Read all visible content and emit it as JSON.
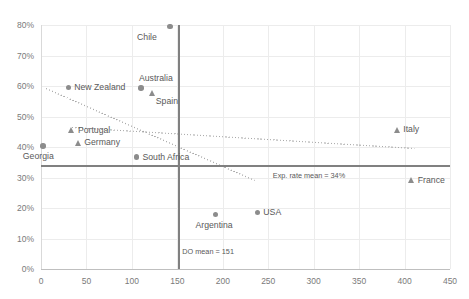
{
  "chart_data": {
    "type": "scatter",
    "title": "",
    "xlabel": "",
    "ylabel": "",
    "xlim": [
      0,
      450
    ],
    "ylim": [
      0,
      0.8
    ],
    "xticks": [
      "0",
      "50",
      "100",
      "150",
      "200",
      "250",
      "300",
      "350",
      "400",
      "450"
    ],
    "yticks": [
      "0%",
      "10%",
      "20%",
      "30%",
      "40%",
      "50%",
      "60%",
      "70%",
      "80%"
    ],
    "grid": true,
    "legend": "none",
    "marker_color": "#8c8c8c",
    "reference_lines": [
      {
        "name": "do-mean-line",
        "orientation": "vertical",
        "value": 151,
        "label": "DO mean = 151"
      },
      {
        "name": "exp-rate-mean-line",
        "orientation": "horizontal",
        "value": 0.34,
        "label": "Exp. rate mean = 34%"
      }
    ],
    "trendlines": [
      {
        "name": "steep-trendline",
        "x0": 5,
        "y0": 0.595,
        "x1": 235,
        "y1": 0.293,
        "style": "dotted"
      },
      {
        "name": "flat-trendline",
        "x0": 34,
        "y0": 0.466,
        "x1": 411,
        "y1": 0.397,
        "style": "dotted"
      }
    ],
    "points": [
      {
        "label": "Chile",
        "x": 142,
        "y": 0.795,
        "marker": "circle",
        "label_pos": "below-left"
      },
      {
        "label": "New Zealand",
        "x": 30,
        "y": 0.595,
        "marker": "circle",
        "label_pos": "right"
      },
      {
        "label": "Australia",
        "x": 110,
        "y": 0.593,
        "marker": "circle",
        "label_pos": "above-right"
      },
      {
        "label": "Spain",
        "x": 123,
        "y": 0.578,
        "marker": "triangle",
        "label_pos": "below-right"
      },
      {
        "label": "Portugal",
        "x": 34,
        "y": 0.455,
        "marker": "triangle",
        "label_pos": "right"
      },
      {
        "label": "Germany",
        "x": 41,
        "y": 0.414,
        "marker": "triangle",
        "label_pos": "right"
      },
      {
        "label": "Georgia",
        "x": 2,
        "y": 0.403,
        "marker": "circle",
        "label_pos": "below"
      },
      {
        "label": "South Africa",
        "x": 105,
        "y": 0.367,
        "marker": "circle",
        "label_pos": "right"
      },
      {
        "label": "Italy",
        "x": 392,
        "y": 0.457,
        "marker": "triangle",
        "label_pos": "right"
      },
      {
        "label": "France",
        "x": 408,
        "y": 0.29,
        "marker": "triangle",
        "label_pos": "right"
      },
      {
        "label": "Argentina",
        "x": 192,
        "y": 0.178,
        "marker": "circle",
        "label_pos": "below"
      },
      {
        "label": "USA",
        "x": 238,
        "y": 0.185,
        "marker": "circle",
        "label_pos": "right"
      }
    ]
  }
}
